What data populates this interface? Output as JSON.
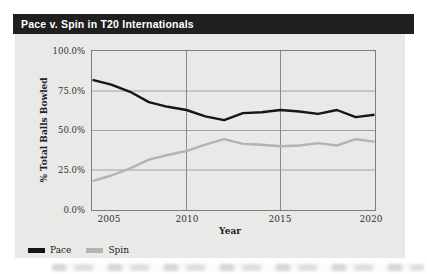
{
  "header": {
    "title": "Pace v. Spin in T20 Internationals"
  },
  "chart_data": {
    "type": "line",
    "title": "Pace v. Spin in T20 Internationals",
    "xlabel": "Year",
    "ylabel": "% Total Balls Bowled",
    "xlim": [
      2005,
      2020
    ],
    "ylim": [
      0,
      100
    ],
    "grid": true,
    "legend_position": "bottom-left",
    "x": [
      2005,
      2006,
      2007,
      2008,
      2009,
      2010,
      2011,
      2012,
      2013,
      2014,
      2015,
      2016,
      2017,
      2018,
      2019,
      2020
    ],
    "series": [
      {
        "name": "Pace",
        "color": "#161616",
        "values": [
          82,
          79,
          74.5,
          68,
          65,
          63,
          59,
          56.5,
          61,
          61.5,
          63,
          62,
          60.5,
          63,
          58.5,
          60
        ]
      },
      {
        "name": "Spin",
        "color": "#b3b3b3",
        "values": [
          18,
          21.5,
          26,
          31.5,
          34.5,
          37,
          41,
          44.5,
          41.5,
          41,
          40,
          40.5,
          42,
          40.5,
          44.5,
          43
        ]
      }
    ],
    "x_ticks": [
      "2005",
      "2010",
      "2015",
      "2020"
    ],
    "y_ticks": [
      "100.0%",
      "75.0%",
      "50.0%",
      "25.0%",
      "0.0%"
    ],
    "x_gridlines": [
      2010,
      2015
    ],
    "y_gridlines": [
      25,
      50,
      75
    ]
  },
  "colors": {
    "title_bar_bg": "#1f1f1f",
    "title_text": "#ffffff",
    "card_bg": "#e9e9e7",
    "plot_border": "#7e7e7e",
    "gridline_h": "#a0a0a0",
    "gridline_v": "#8a8a8a",
    "axis_text": "#333333"
  }
}
